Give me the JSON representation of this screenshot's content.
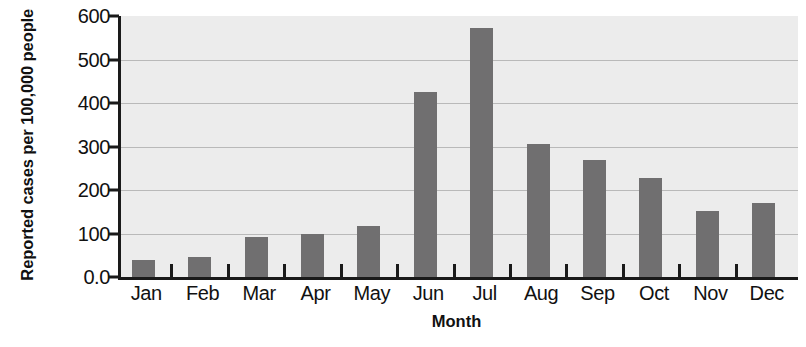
{
  "chart_data": {
    "type": "bar",
    "title": "",
    "xlabel": "Month",
    "ylabel": "Reported cases per 100,000 people",
    "categories": [
      "Jan",
      "Feb",
      "Mar",
      "Apr",
      "May",
      "Jun",
      "Jul",
      "Aug",
      "Sep",
      "Oct",
      "Nov",
      "Dec"
    ],
    "values": [
      40,
      47,
      92,
      99,
      117,
      425,
      573,
      305,
      270,
      228,
      152,
      170
    ],
    "ylim": [
      0,
      600
    ],
    "ytick_labels": [
      "0.0",
      "100",
      "200",
      "300",
      "400",
      "500",
      "600"
    ],
    "ytick_values": [
      0,
      100,
      200,
      300,
      400,
      500,
      600
    ],
    "grid": true,
    "grid_axis": "y",
    "legend": null,
    "series": [
      {
        "name": "Reported cases per 100,000 people",
        "values": [
          40,
          47,
          92,
          99,
          117,
          425,
          573,
          305,
          270,
          228,
          152,
          170
        ]
      }
    ]
  },
  "colors": {
    "bar": "#706f70",
    "plot_background": "#ececec",
    "gridline": "#b9b9b9",
    "axis": "#1a1a1a",
    "text": "#111111",
    "figure_background": "#ffffff"
  }
}
